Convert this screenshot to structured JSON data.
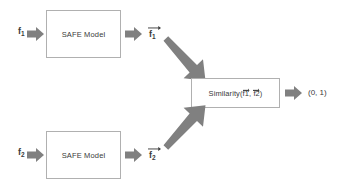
{
  "diagram": {
    "background_color": "#ffffff",
    "box_border_color": "#b0b0b0",
    "arrow_color": "#808080",
    "text_color": "#3a3a3a",
    "inputs": [
      {
        "id": "f1",
        "base": "f",
        "subscript": "1"
      },
      {
        "id": "f2",
        "base": "f",
        "subscript": "2"
      }
    ],
    "model_boxes": [
      {
        "id": "safe-model-top",
        "label": "SAFE Model"
      },
      {
        "id": "safe-model-bottom",
        "label": "SAFE Model"
      }
    ],
    "embeddings": [
      {
        "id": "vec-f1",
        "base": "f",
        "subscript": "1",
        "vector": true
      },
      {
        "id": "vec-f2",
        "base": "f",
        "subscript": "2",
        "vector": true
      }
    ],
    "similarity": {
      "prefix": "Similarity(",
      "arg1": "f1",
      "separator": ", ",
      "arg2": "f2",
      "suffix": ")",
      "full_text": "Similarity(f1, f2)"
    },
    "output": {
      "label": "(0, 1)"
    },
    "arrows": [
      {
        "id": "arrow-f1-to-model",
        "kind": "block-right"
      },
      {
        "id": "arrow-model-to-vecf1",
        "kind": "block-right"
      },
      {
        "id": "arrow-f2-to-model",
        "kind": "block-right"
      },
      {
        "id": "arrow-model-to-vecf2",
        "kind": "block-right"
      },
      {
        "id": "arrow-vecf1-to-similarity",
        "kind": "diagonal-down-right"
      },
      {
        "id": "arrow-vecf2-to-similarity",
        "kind": "diagonal-up-right"
      },
      {
        "id": "arrow-similarity-to-output",
        "kind": "block-right"
      }
    ]
  }
}
